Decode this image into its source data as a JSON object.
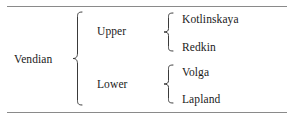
{
  "figure": {
    "kind": "stratigraphic-hierarchy-table",
    "rules": {
      "top": "horizontal-rule",
      "bottom": "horizontal-rule"
    }
  },
  "hierarchy": {
    "root": {
      "label": "Vendian"
    },
    "levels": [
      {
        "label": "Upper",
        "children": [
          {
            "label": "Kotlinskaya"
          },
          {
            "label": "Redkin"
          }
        ]
      },
      {
        "label": "Lower",
        "children": [
          {
            "label": "Volga"
          },
          {
            "label": "Lapland"
          }
        ]
      }
    ]
  },
  "braces": {
    "main": "curly-brace-icon",
    "upper": "curly-brace-icon",
    "lower": "curly-brace-icon"
  },
  "colors": {
    "text": "#1a1a1a",
    "rule": "#8a8a8a",
    "brace": "#3a3a3a",
    "background": "#ffffff"
  }
}
